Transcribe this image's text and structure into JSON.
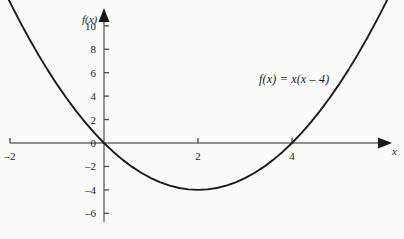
{
  "figure": {
    "background_color": "#fbfbfa",
    "ink_color": "#1a1a1a",
    "axis_color": "#5a5a5a"
  },
  "chart_data": {
    "type": "line",
    "title": "",
    "subtitle": "",
    "xlabel": "x",
    "ylabel": "f(x)",
    "equation": "f(x)  =  x(x – 4)",
    "function": "f(x) = x(x - 4)",
    "xlim": [
      -2.2,
      6.4
    ],
    "ylim": [
      -7.5,
      11.5
    ],
    "grid": false,
    "legend": null,
    "x_ticks": [
      -2,
      2,
      4
    ],
    "x_tick_labels": [
      "–2",
      "2",
      "4"
    ],
    "y_ticks": [
      10,
      8,
      6,
      4,
      2,
      0,
      -2,
      -4,
      -6
    ],
    "y_tick_labels": [
      "10",
      "8",
      "6",
      "4",
      "2",
      "0",
      "–2",
      "–4",
      "–6"
    ],
    "roots": [
      0,
      4
    ],
    "vertex": [
      2,
      -4
    ],
    "series": [
      {
        "name": "f(x) = x(x - 4)",
        "color": "#1a1a1a",
        "x": [
          -2.2,
          -2.0,
          -1.8,
          -1.6,
          -1.4,
          -1.2,
          -1.0,
          -0.8,
          -0.6,
          -0.4,
          -0.2,
          0.0,
          0.2,
          0.4,
          0.6,
          0.8,
          1.0,
          1.2,
          1.4,
          1.6,
          1.8,
          2.0,
          2.2,
          2.4,
          2.6,
          2.8,
          3.0,
          3.2,
          3.4,
          3.6,
          3.8,
          4.0,
          4.2,
          4.4,
          4.6,
          4.8,
          5.0,
          5.2,
          5.4,
          5.6,
          5.8,
          6.0,
          6.2
        ],
        "y": [
          13.64,
          12.0,
          10.44,
          8.96,
          7.56,
          6.24,
          5.0,
          3.84,
          2.76,
          1.76,
          0.84,
          0.0,
          -0.76,
          -1.44,
          -2.04,
          -2.56,
          -3.0,
          -3.36,
          -3.64,
          -3.84,
          -3.96,
          -4.0,
          -3.96,
          -3.84,
          -3.64,
          -3.36,
          -3.0,
          -2.56,
          -2.04,
          -1.44,
          -0.76,
          0.0,
          0.84,
          1.76,
          2.76,
          3.84,
          5.0,
          6.24,
          7.56,
          8.96,
          10.44,
          12.0,
          13.64
        ]
      }
    ]
  },
  "annotations": {
    "equation_label": "f(x)  =  x(x – 4)",
    "y_axis_label": "f(x)",
    "x_axis_label": "x"
  }
}
